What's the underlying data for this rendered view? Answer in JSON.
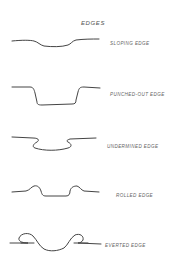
{
  "diagram": {
    "title": "EDGES",
    "items": [
      {
        "id": "sloping",
        "label": "SLOPING EDGE"
      },
      {
        "id": "punched-out",
        "label": "PUNCHED-OUT EDGE"
      },
      {
        "id": "undermined",
        "label": "UNDERMINED EDGE"
      },
      {
        "id": "rolled",
        "label": "ROLLED EDGE"
      },
      {
        "id": "everted",
        "label": "EVERTED EDGE"
      }
    ]
  }
}
